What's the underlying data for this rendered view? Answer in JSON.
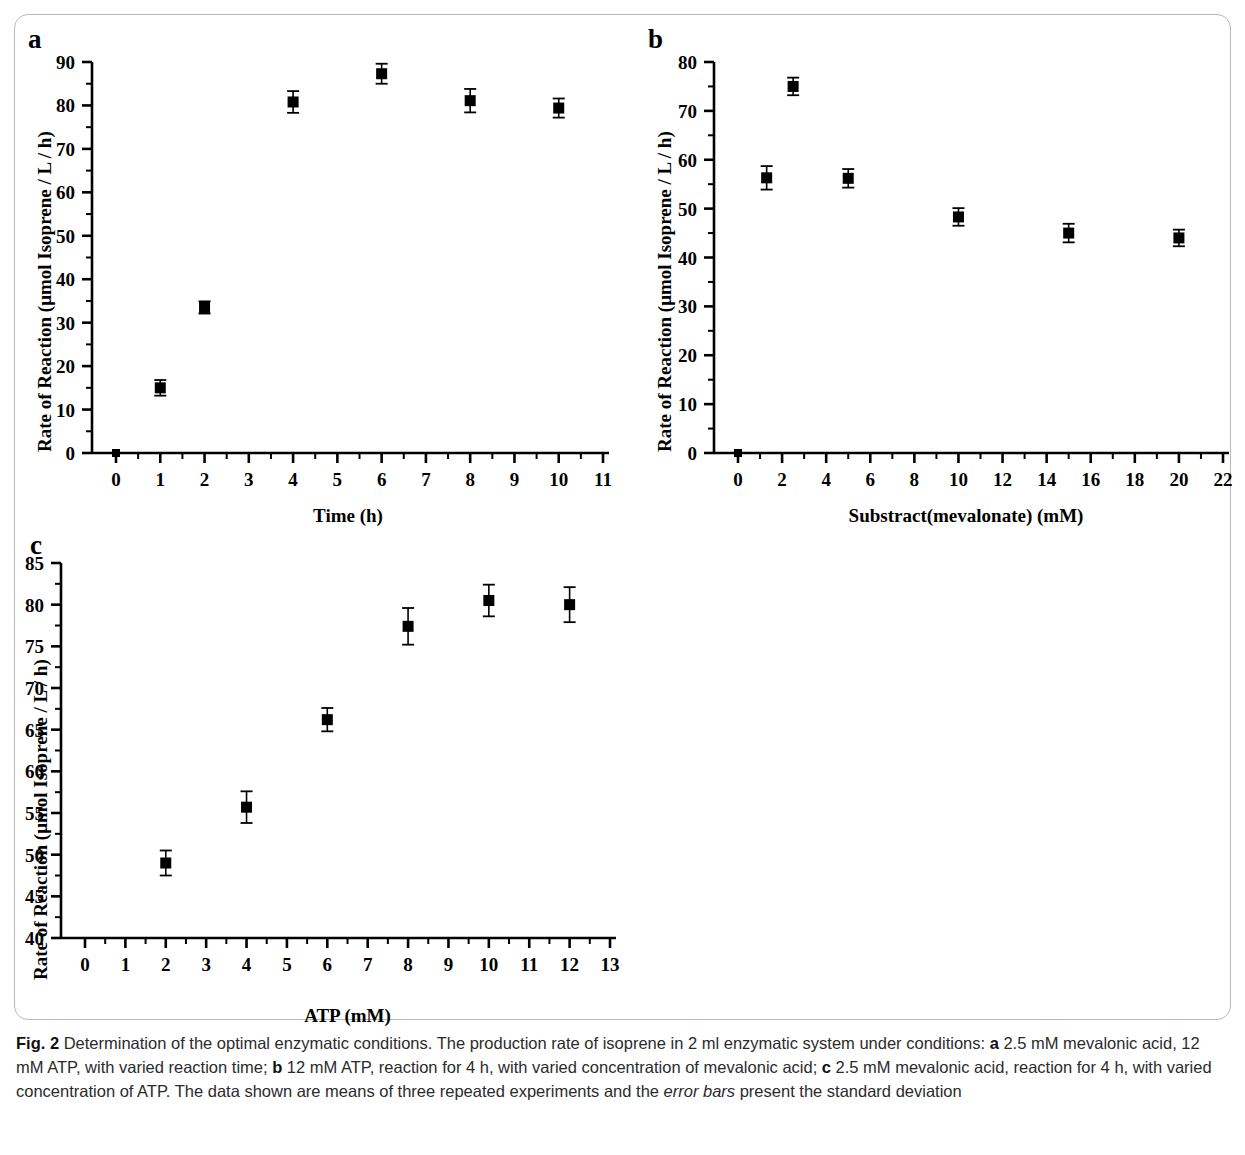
{
  "figure": {
    "caption_label": "Fig. 2",
    "caption_text": " Determination of the optimal enzymatic conditions. The production rate of isoprene in 2 ml enzymatic system under conditions: ",
    "caption_a_marker": "a",
    "caption_a_text": " 2.5 mM mevalonic acid, 12 mM ATP, with varied reaction time; ",
    "caption_b_marker": "b",
    "caption_b_text": " 12 mM ATP, reaction for 4 h, with varied concentration of mevalonic acid; ",
    "caption_c_marker": "c",
    "caption_c_text": " 2.5 mM mevalonic acid, reaction for 4 h, with varied concentration of ATP. The data shown are means of three repeated experiments and the ",
    "caption_italic": "error bars",
    "caption_tail": " present the standard deviation",
    "marker_color": "#000000",
    "axis_color": "#000000",
    "frame_color": "#b9b9b9"
  },
  "chart_data": [
    {
      "panel": "a",
      "type": "scatter",
      "title": "",
      "xlabel": "Time (h)",
      "ylabel": "Rate of Reaction (μmol Isoprene / L / h)",
      "xlim": [
        0,
        11
      ],
      "ylim": [
        0,
        90
      ],
      "xticks": [
        0,
        1,
        2,
        3,
        4,
        5,
        6,
        7,
        8,
        9,
        10,
        11
      ],
      "xtick_labels": [
        "0",
        "1",
        "2",
        "3",
        "4",
        "5",
        "6",
        "7",
        "8",
        "9",
        "10",
        "11"
      ],
      "yticks": [
        0,
        10,
        20,
        30,
        40,
        50,
        60,
        70,
        80,
        90
      ],
      "ytick_labels": [
        "0",
        "10",
        "20",
        "30",
        "40",
        "50",
        "60",
        "70",
        "80",
        "90"
      ],
      "minor_ticks": true,
      "grid": false,
      "legend": "none",
      "x": [
        0,
        1,
        2,
        4,
        6,
        8,
        10
      ],
      "values": [
        0,
        15.0,
        33.5,
        80.8,
        87.3,
        81.1,
        79.4
      ],
      "errors": [
        0,
        1.8,
        1.4,
        2.5,
        2.3,
        2.7,
        2.2
      ]
    },
    {
      "panel": "b",
      "type": "scatter",
      "title": "",
      "xlabel": "Substract(mevalonate) (mM)",
      "ylabel": "Rate of Reaction (μmol Isoprene / L / h)",
      "xlim": [
        0,
        22
      ],
      "ylim": [
        0,
        80
      ],
      "xticks": [
        0,
        2,
        4,
        6,
        8,
        10,
        12,
        14,
        16,
        18,
        20,
        22
      ],
      "xtick_labels": [
        "0",
        "2",
        "4",
        "6",
        "8",
        "10",
        "12",
        "14",
        "16",
        "18",
        "20",
        "22"
      ],
      "yticks": [
        0,
        10,
        20,
        30,
        40,
        50,
        60,
        70,
        80
      ],
      "ytick_labels": [
        "0",
        "10",
        "20",
        "30",
        "40",
        "50",
        "60",
        "70",
        "80"
      ],
      "minor_ticks": true,
      "grid": false,
      "legend": "none",
      "x": [
        0,
        1.3,
        2.5,
        5,
        10,
        15,
        20
      ],
      "values": [
        0,
        56.3,
        75.0,
        56.2,
        48.3,
        45.0,
        44.0
      ],
      "errors": [
        0,
        2.4,
        1.8,
        1.9,
        1.8,
        1.9,
        1.7
      ]
    },
    {
      "panel": "c",
      "type": "scatter",
      "title": "",
      "xlabel": "ATP (mM)",
      "ylabel": "Rate of Reaction (μmol Isoprene / L / h)",
      "xlim": [
        0,
        13
      ],
      "ylim": [
        40,
        85
      ],
      "xticks": [
        0,
        1,
        2,
        3,
        4,
        5,
        6,
        7,
        8,
        9,
        10,
        11,
        12,
        13
      ],
      "xtick_labels": [
        "0",
        "1",
        "2",
        "3",
        "4",
        "5",
        "6",
        "7",
        "8",
        "9",
        "10",
        "11",
        "12",
        "13"
      ],
      "yticks": [
        40,
        45,
        50,
        55,
        60,
        65,
        70,
        75,
        80,
        85
      ],
      "ytick_labels": [
        "40",
        "45",
        "50",
        "55",
        "60",
        "65",
        "70",
        "75",
        "80",
        "85"
      ],
      "minor_ticks": true,
      "grid": false,
      "legend": "none",
      "x": [
        2,
        4,
        6,
        8,
        10,
        12
      ],
      "values": [
        49.0,
        55.7,
        66.2,
        77.4,
        80.5,
        80.0
      ],
      "errors": [
        1.5,
        1.9,
        1.4,
        2.2,
        1.9,
        2.1
      ]
    }
  ]
}
